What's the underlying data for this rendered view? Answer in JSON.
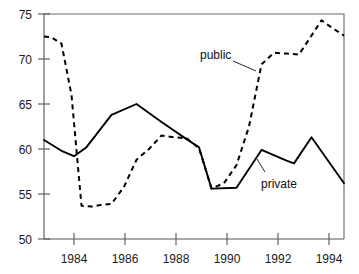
{
  "chart_data": {
    "type": "line",
    "title": "",
    "subtitle": "",
    "xlabel": "",
    "ylabel": "",
    "xlim": [
      1982.3,
      1994.3
    ],
    "ylim": [
      50,
      75
    ],
    "grid": false,
    "legend_position": "inline-annotation",
    "x_ticks": [
      1984,
      1986,
      1988,
      1990,
      1992,
      1994
    ],
    "x_tick_labels": [
      "1984",
      "1986",
      "1988",
      "1990",
      "1992",
      "1994"
    ],
    "y_ticks": [
      50,
      55,
      60,
      65,
      70,
      75
    ],
    "y_tick_labels": [
      "50",
      "55",
      "60",
      "65",
      "70",
      "75"
    ],
    "annotations": [
      {
        "text": "public",
        "x": 1989.0,
        "y": 71.3
      },
      {
        "text": "private",
        "x": 1991.7,
        "y": 57.0
      }
    ],
    "series": [
      {
        "name": "public",
        "style": "dashed",
        "color": "#000000",
        "x": [
          1982.3,
          1982.6,
          1983.0,
          1983.4,
          1983.8,
          1984.2,
          1984.6,
          1985.0,
          1985.5,
          1986.0,
          1986.5,
          1987.0,
          1987.5,
          1988.0,
          1988.5,
          1989.0,
          1989.5,
          1990.0,
          1990.5,
          1991.0,
          1991.5,
          1992.0,
          1992.5,
          1993.0,
          1993.4,
          1993.8,
          1994.3
        ],
        "values": [
          72.5,
          72.4,
          71.7,
          66.0,
          53.7,
          53.6,
          53.8,
          53.9,
          55.8,
          58.8,
          60.0,
          61.5,
          61.3,
          61.2,
          60.1,
          55.6,
          56.2,
          58.2,
          62.5,
          69.4,
          70.7,
          70.6,
          70.5,
          72.6,
          74.3,
          73.5,
          72.6
        ]
      },
      {
        "name": "private",
        "style": "solid",
        "color": "#000000",
        "x": [
          1982.3,
          1983.0,
          1983.5,
          1984.0,
          1985.0,
          1986.0,
          1987.0,
          1988.0,
          1988.5,
          1989.0,
          1990.0,
          1991.0,
          1992.0,
          1992.3,
          1993.0,
          1994.3
        ],
        "values": [
          61.0,
          59.8,
          59.2,
          60.2,
          63.8,
          65.0,
          63.0,
          61.1,
          60.2,
          55.6,
          55.7,
          59.9,
          58.7,
          58.4,
          61.3,
          56.2
        ]
      }
    ]
  },
  "labels": {
    "public": "public",
    "private": "private",
    "y_75": "75",
    "y_70": "70",
    "y_65": "65",
    "y_60": "60",
    "y_55": "55",
    "y_50": "50",
    "x_1984": "1984",
    "x_1986": "1986",
    "x_1988": "1988",
    "x_1990": "1990",
    "x_1992": "1992",
    "x_1994": "1994"
  },
  "colors": {
    "series_line": "#000000",
    "axis": "#555555",
    "frame": "#6b6b6b",
    "background": "#ffffff",
    "text": "#1a1a1a"
  }
}
